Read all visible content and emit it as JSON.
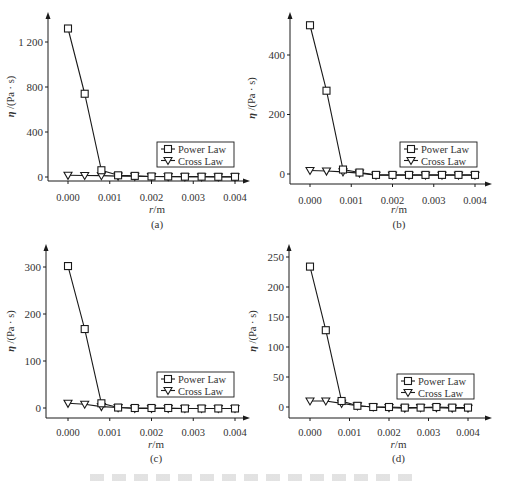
{
  "figure": {
    "caption_visible": false
  },
  "chart_data": [
    {
      "id": "a",
      "type": "line",
      "panel_label": "(a)",
      "xlabel": "r/m",
      "ylabel": "η /(Pa · s)",
      "x_ticks": [
        "0.000",
        "0.001",
        "0.002",
        "0.003",
        "0.004"
      ],
      "y_ticks": [
        "0",
        "400",
        "800",
        "1 200"
      ],
      "y_tick_values": [
        0,
        400,
        800,
        1200
      ],
      "ylim": [
        0,
        1200
      ],
      "xlim": [
        0,
        0.004
      ],
      "grid": false,
      "legend": [
        "Power Law",
        "Cross Law"
      ],
      "legend_position": "lower right",
      "x": [
        0.0,
        0.0004,
        0.0008,
        0.0012,
        0.0016,
        0.002,
        0.0024,
        0.0028,
        0.0032,
        0.0036,
        0.004
      ],
      "series": [
        {
          "name": "Power Law",
          "marker": "square",
          "values": [
            1320,
            740,
            60,
            15,
            10,
            5,
            5,
            3,
            3,
            2,
            2
          ]
        },
        {
          "name": "Cross Law",
          "marker": "triangle-down",
          "values": [
            15,
            14,
            12,
            8,
            6,
            4,
            3,
            2,
            2,
            1,
            1
          ]
        }
      ]
    },
    {
      "id": "b",
      "type": "line",
      "panel_label": "(b)",
      "xlabel": "r/m",
      "ylabel": "η /(Pa · s)",
      "x_ticks": [
        "0.000",
        "0.001",
        "0.002",
        "0.003",
        "0.004"
      ],
      "y_ticks": [
        "0",
        "200",
        "400"
      ],
      "y_tick_values": [
        0,
        200,
        400
      ],
      "ylim": [
        0,
        500
      ],
      "xlim": [
        0,
        0.004
      ],
      "grid": false,
      "legend": [
        "Power Law",
        "Cross Law"
      ],
      "legend_position": "lower right",
      "x": [
        0.0,
        0.0004,
        0.0008,
        0.0012,
        0.0016,
        0.002,
        0.0024,
        0.0028,
        0.0032,
        0.0036,
        0.004
      ],
      "series": [
        {
          "name": "Power Law",
          "marker": "square",
          "values": [
            500,
            280,
            15,
            5,
            -3,
            -3,
            -3,
            -3,
            -3,
            -3,
            -3
          ]
        },
        {
          "name": "Cross Law",
          "marker": "triangle-down",
          "values": [
            12,
            10,
            7,
            3,
            -4,
            -4,
            -4,
            -4,
            -4,
            -4,
            -4
          ]
        }
      ]
    },
    {
      "id": "c",
      "type": "line",
      "panel_label": "(c)",
      "xlabel": "r/m",
      "ylabel": "η /(Pa · s)",
      "x_ticks": [
        "0.000",
        "0.001",
        "0.002",
        "0.003",
        "0.004"
      ],
      "y_ticks": [
        "0",
        "100",
        "200",
        "300"
      ],
      "y_tick_values": [
        0,
        100,
        200,
        300
      ],
      "ylim": [
        0,
        300
      ],
      "xlim": [
        0,
        0.004
      ],
      "grid": false,
      "legend": [
        "Power Law",
        "Cross Law"
      ],
      "legend_position": "lower right",
      "x": [
        0.0,
        0.0004,
        0.0008,
        0.0012,
        0.0016,
        0.002,
        0.0024,
        0.0028,
        0.0032,
        0.0036,
        0.004
      ],
      "series": [
        {
          "name": "Power Law",
          "marker": "square",
          "values": [
            302,
            168,
            10,
            1,
            0,
            0,
            0,
            -1,
            -1,
            -1,
            -1
          ]
        },
        {
          "name": "Cross Law",
          "marker": "triangle-down",
          "values": [
            10,
            8,
            3,
            1,
            -1,
            -1,
            -1,
            -1,
            -1,
            -1,
            -1
          ]
        }
      ]
    },
    {
      "id": "d",
      "type": "line",
      "panel_label": "(d)",
      "xlabel": "r/m",
      "ylabel": "η /(Pa · s)",
      "x_ticks": [
        "0.000",
        "0.001",
        "0.002",
        "0.003",
        "0.004"
      ],
      "y_ticks": [
        "0",
        "50",
        "100",
        "150",
        "200",
        "250"
      ],
      "y_tick_values": [
        0,
        50,
        100,
        150,
        200,
        250
      ],
      "ylim": [
        0,
        250
      ],
      "xlim": [
        0,
        0.004
      ],
      "grid": false,
      "legend": [
        "Power Law",
        "Cross Law"
      ],
      "legend_position": "lower right",
      "x": [
        0.0,
        0.0004,
        0.0008,
        0.0012,
        0.0016,
        0.002,
        0.0024,
        0.0028,
        0.0032,
        0.0036,
        0.004
      ],
      "series": [
        {
          "name": "Power Law",
          "marker": "square",
          "values": [
            234,
            128,
            10,
            2,
            0,
            0,
            -1,
            -1,
            0,
            -1,
            -1
          ]
        },
        {
          "name": "Cross Law",
          "marker": "triangle-down",
          "values": [
            10,
            10,
            6,
            2,
            0,
            -1,
            -2,
            -1,
            -1,
            -2,
            -2
          ]
        }
      ]
    }
  ],
  "layout": {
    "panels": [
      {
        "id": "a",
        "axisX": 48,
        "axisTop": 12,
        "y0": 177,
        "yTopVal": 1200,
        "yTopPx": 42,
        "xAxisY": 181,
        "xStart": 68,
        "xEnd": 235,
        "xAxisEnd": 250,
        "xAxisStart": 48,
        "legendX": 157,
        "legendY": 142,
        "xlabelY": 213,
        "panelLabelY": 228,
        "tickLabelY": 197,
        "ylabelX": 14
      },
      {
        "id": "b",
        "axisX": 290,
        "axisTop": 12,
        "y0": 174,
        "yTopVal": 400,
        "yTopPx": 55,
        "xAxisY": 184,
        "xStart": 310,
        "xEnd": 475,
        "xAxisEnd": 492,
        "xAxisStart": 290,
        "legendX": 400,
        "legendY": 142,
        "xlabelY": 213,
        "panelLabelY": 228,
        "tickLabelY": 200,
        "ylabelX": 255
      },
      {
        "id": "c",
        "axisX": 46,
        "axisTop": 244,
        "y0": 408,
        "yTopVal": 300,
        "yTopPx": 267,
        "xAxisY": 418,
        "xStart": 68,
        "xEnd": 235,
        "xAxisEnd": 250,
        "xAxisStart": 46,
        "legendX": 157,
        "legendY": 372,
        "xlabelY": 448,
        "panelLabelY": 462,
        "tickLabelY": 432,
        "ylabelX": 14
      },
      {
        "id": "d",
        "axisX": 289,
        "axisTop": 244,
        "y0": 407,
        "yTopVal": 250,
        "yTopPx": 257,
        "xAxisY": 418,
        "xStart": 310,
        "xEnd": 468,
        "xAxisEnd": 492,
        "xAxisStart": 289,
        "legendX": 397,
        "legendY": 374,
        "xlabelY": 448,
        "panelLabelY": 462,
        "tickLabelY": 432,
        "ylabelX": 256
      }
    ]
  }
}
